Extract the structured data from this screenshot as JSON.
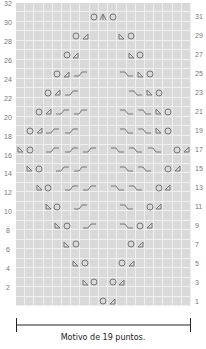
{
  "chart_data": {
    "type": "knitting-chart",
    "columns": 19,
    "rows": 32,
    "left_labels": [
      "32",
      "30",
      "28",
      "26",
      "24",
      "22",
      "20",
      "18",
      "16",
      "14",
      "12",
      "10",
      "8",
      "6",
      "4",
      "2"
    ],
    "right_labels": [
      "31",
      "29",
      "27",
      "25",
      "23",
      "21",
      "19",
      "17",
      "15",
      "13",
      "11",
      "9",
      "7",
      "5",
      "3",
      "1"
    ],
    "legend_symbols": {
      "yo": "yarn-over circle",
      "k2tog": "right-leaning decrease triangle",
      "ssk": "left-leaning decrease triangle",
      "cdd": "central double decrease",
      "cable_left": "left-rising cable over 2 stitches",
      "cable_right": "right-falling cable over 2 stitches"
    },
    "pattern_rows": [
      {
        "row": 1,
        "stitches": [
          {
            "col": 10,
            "s": "yo"
          },
          {
            "col": 11,
            "s": "k2tog"
          }
        ]
      },
      {
        "row": 3,
        "stitches": [
          {
            "col": 8,
            "s": "ssk"
          },
          {
            "col": 9,
            "s": "yo"
          },
          {
            "col": 11,
            "s": "yo"
          },
          {
            "col": 12,
            "s": "k2tog"
          }
        ]
      },
      {
        "row": 5,
        "stitches": [
          {
            "col": 7,
            "s": "ssk"
          },
          {
            "col": 8,
            "s": "yo"
          },
          {
            "col": 12,
            "s": "yo"
          },
          {
            "col": 13,
            "s": "k2tog"
          }
        ]
      },
      {
        "row": 7,
        "stitches": [
          {
            "col": 6,
            "s": "ssk"
          },
          {
            "col": 7,
            "s": "yo"
          },
          {
            "col": 13,
            "s": "yo"
          },
          {
            "col": 14,
            "s": "k2tog"
          }
        ]
      },
      {
        "row": 9,
        "stitches": [
          {
            "col": 5,
            "s": "ssk"
          },
          {
            "col": 6,
            "s": "yo"
          },
          {
            "col": 8,
            "s": "cable_left"
          },
          {
            "col": 12,
            "s": "cable_right"
          },
          {
            "col": 14,
            "s": "yo"
          },
          {
            "col": 15,
            "s": "k2tog"
          }
        ]
      },
      {
        "row": 11,
        "stitches": [
          {
            "col": 4,
            "s": "ssk"
          },
          {
            "col": 5,
            "s": "yo"
          },
          {
            "col": 7,
            "s": "cable_left"
          },
          {
            "col": 12,
            "s": "cable_right"
          },
          {
            "col": 15,
            "s": "yo"
          },
          {
            "col": 16,
            "s": "k2tog"
          }
        ]
      },
      {
        "row": 13,
        "stitches": [
          {
            "col": 3,
            "s": "ssk"
          },
          {
            "col": 4,
            "s": "yo"
          },
          {
            "col": 6,
            "s": "cable_left"
          },
          {
            "col": 8,
            "s": "cable_left"
          },
          {
            "col": 11,
            "s": "cable_right"
          },
          {
            "col": 13,
            "s": "cable_right"
          },
          {
            "col": 16,
            "s": "yo"
          },
          {
            "col": 17,
            "s": "k2tog"
          }
        ]
      },
      {
        "row": 15,
        "stitches": [
          {
            "col": 2,
            "s": "ssk"
          },
          {
            "col": 3,
            "s": "yo"
          },
          {
            "col": 5,
            "s": "cable_left"
          },
          {
            "col": 7,
            "s": "cable_left"
          },
          {
            "col": 12,
            "s": "cable_right"
          },
          {
            "col": 14,
            "s": "cable_right"
          },
          {
            "col": 17,
            "s": "yo"
          },
          {
            "col": 18,
            "s": "k2tog"
          }
        ]
      },
      {
        "row": 17,
        "stitches": [
          {
            "col": 1,
            "s": "ssk"
          },
          {
            "col": 2,
            "s": "yo"
          },
          {
            "col": 4,
            "s": "cable_left"
          },
          {
            "col": 6,
            "s": "cable_left"
          },
          {
            "col": 8,
            "s": "cable_left"
          },
          {
            "col": 11,
            "s": "cable_right"
          },
          {
            "col": 13,
            "s": "cable_right"
          },
          {
            "col": 15,
            "s": "cable_right"
          },
          {
            "col": 18,
            "s": "yo"
          },
          {
            "col": 19,
            "s": "k2tog"
          }
        ]
      },
      {
        "row": 19,
        "stitches": [
          {
            "col": 2,
            "s": "yo"
          },
          {
            "col": 3,
            "s": "k2tog"
          },
          {
            "col": 4,
            "s": "cable_left"
          },
          {
            "col": 6,
            "s": "cable_left"
          },
          {
            "col": 12,
            "s": "cable_right"
          },
          {
            "col": 14,
            "s": "cable_right"
          },
          {
            "col": 16,
            "s": "ssk"
          },
          {
            "col": 17,
            "s": "yo"
          }
        ]
      },
      {
        "row": 21,
        "stitches": [
          {
            "col": 3,
            "s": "yo"
          },
          {
            "col": 4,
            "s": "k2tog"
          },
          {
            "col": 5,
            "s": "cable_left"
          },
          {
            "col": 7,
            "s": "cable_left"
          },
          {
            "col": 12,
            "s": "cable_right"
          },
          {
            "col": 14,
            "s": "cable_right"
          },
          {
            "col": 16,
            "s": "ssk"
          },
          {
            "col": 17,
            "s": "yo"
          }
        ]
      },
      {
        "row": 23,
        "stitches": [
          {
            "col": 4,
            "s": "yo"
          },
          {
            "col": 5,
            "s": "k2tog"
          },
          {
            "col": 6,
            "s": "cable_left"
          },
          {
            "col": 13,
            "s": "cable_right"
          },
          {
            "col": 15,
            "s": "ssk"
          },
          {
            "col": 16,
            "s": "yo"
          }
        ]
      },
      {
        "row": 25,
        "stitches": [
          {
            "col": 5,
            "s": "yo"
          },
          {
            "col": 6,
            "s": "k2tog"
          },
          {
            "col": 7,
            "s": "cable_left"
          },
          {
            "col": 12,
            "s": "cable_right"
          },
          {
            "col": 14,
            "s": "ssk"
          },
          {
            "col": 15,
            "s": "yo"
          }
        ]
      },
      {
        "row": 27,
        "stitches": [
          {
            "col": 6,
            "s": "yo"
          },
          {
            "col": 7,
            "s": "k2tog"
          },
          {
            "col": 13,
            "s": "ssk"
          },
          {
            "col": 14,
            "s": "yo"
          }
        ]
      },
      {
        "row": 29,
        "stitches": [
          {
            "col": 7,
            "s": "yo"
          },
          {
            "col": 8,
            "s": "k2tog"
          },
          {
            "col": 12,
            "s": "ssk"
          },
          {
            "col": 13,
            "s": "yo"
          }
        ]
      },
      {
        "row": 31,
        "stitches": [
          {
            "col": 9,
            "s": "yo"
          },
          {
            "col": 10,
            "s": "cdd"
          },
          {
            "col": 11,
            "s": "yo"
          }
        ]
      }
    ],
    "caption": "Motivo de 19 puntos.",
    "colors": {
      "grid_bg": "#d9d9d9",
      "grid_line": "#efefef",
      "symbol": "#777777",
      "bar": "#222222"
    }
  }
}
